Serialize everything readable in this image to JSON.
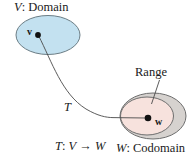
{
  "figure": {
    "background_color": "#ffffff",
    "width": 195,
    "height": 161
  },
  "labels": {
    "domain": "V: Domain",
    "domain_italic_part": "V",
    "domain_rest": ": Domain",
    "codomain": "W: Codomain",
    "codomain_italic_part": "W",
    "codomain_rest": ": Codomain",
    "range": "Range",
    "transformation_label": "T",
    "mapping": "T: V → W",
    "mapping_T": "T",
    "mapping_colon": ": ",
    "mapping_V": "V",
    "mapping_arrow": " → ",
    "mapping_W": "W",
    "vector_v": "v",
    "vector_w": "w"
  },
  "shapes": {
    "domain_ellipse": {
      "name": "domain-ellipse",
      "cx": 48,
      "cy": 35,
      "rx": 32,
      "ry": 19,
      "fill": "#c3e1f0",
      "stroke": "#6a7a80"
    },
    "codomain_ellipse": {
      "name": "codomain-ellipse",
      "cx": 152,
      "cy": 116,
      "rx": 33,
      "ry": 23,
      "fill": "#d6d2cf",
      "stroke": "#6a6a6a"
    },
    "range_ellipse": {
      "name": "range-ellipse",
      "cx": 147,
      "cy": 116,
      "rx": 26,
      "ry": 19,
      "fill": "#f6e0dc",
      "stroke": "#6a6a6a"
    },
    "point_v": {
      "name": "point-v",
      "cx": 38,
      "cy": 35,
      "r": 2.8,
      "fill": "#111111"
    },
    "point_w": {
      "name": "point-w",
      "cx": 148,
      "cy": 118,
      "r": 3.2,
      "fill": "#111111"
    },
    "map_curve": {
      "name": "mapping-curve",
      "path": "M 38.5 35.5 C 56 68, 70 104, 112 117",
      "stroke": "#4a4a4a",
      "stroke_width": 0.9
    },
    "arrow_to_w": {
      "name": "arrow-to-w",
      "path": "M 112 117 L 146 118",
      "stroke": "#4a4a4a"
    },
    "range_leader": {
      "name": "range-leader-line",
      "path": "M 158 80 L 151 104",
      "stroke": "#4a4a4a",
      "stroke_width": 0.9
    }
  },
  "colors": {
    "domain_fill": "#c3e1f0",
    "range_fill": "#f6e0dc",
    "codomain_fill": "#d6d2cf",
    "outline": "#6a6a6a",
    "text": "#1a1a1a",
    "point": "#111111"
  }
}
